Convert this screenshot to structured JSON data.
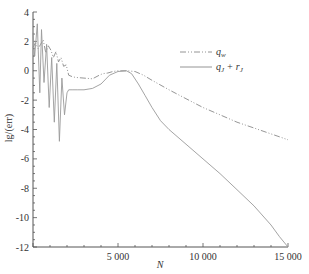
{
  "chart_data": {
    "type": "line",
    "title": "",
    "xlabel": "N",
    "ylabel": "lg/(err)",
    "xlim": [
      0,
      15000
    ],
    "ylim": [
      -12,
      4
    ],
    "x_ticks": [
      5000,
      10000,
      15000
    ],
    "x_tick_labels": [
      "5 000",
      "10 000",
      "15 000"
    ],
    "y_ticks": [
      4,
      2,
      0,
      -2,
      -4,
      -6,
      -8,
      -10,
      -12
    ],
    "y_tick_labels": [
      "4",
      "2",
      "0",
      "-2",
      "-4",
      "-6",
      "-8",
      "-10",
      "-12"
    ],
    "grid": false,
    "legend_position": "upper right",
    "series": [
      {
        "name": "q_w",
        "style": "dash-dot",
        "x": [
          0,
          150,
          300,
          450,
          600,
          750,
          900,
          1050,
          1200,
          1350,
          1500,
          1650,
          1800,
          1950,
          2100,
          2300,
          2500,
          3000,
          3500,
          3900,
          4100,
          4400,
          4700,
          5000,
          5500,
          6000,
          6500,
          7000,
          8000,
          9000,
          10000,
          11000,
          12000,
          13000,
          14000,
          14500,
          15000
        ],
        "y": [
          1.6,
          1.9,
          1.5,
          1.8,
          2.1,
          1.2,
          1.7,
          1.4,
          0.9,
          1.3,
          0.6,
          0.9,
          0.3,
          0.4,
          -0.3,
          -0.4,
          -0.45,
          -0.5,
          -0.55,
          -0.3,
          -0.2,
          -0.15,
          -0.05,
          0.0,
          0.0,
          -0.05,
          -0.3,
          -0.65,
          -1.3,
          -1.9,
          -2.5,
          -3.0,
          -3.5,
          -3.9,
          -4.3,
          -4.5,
          -4.7
        ]
      },
      {
        "name": "q_J + r_J",
        "style": "solid",
        "x": [
          0,
          100,
          250,
          400,
          500,
          650,
          800,
          950,
          1100,
          1250,
          1400,
          1550,
          1700,
          1850,
          2000,
          2100,
          2300,
          2600,
          3000,
          3500,
          4000,
          4500,
          5000,
          5500,
          5800,
          6200,
          6600,
          7000,
          7500,
          8000,
          9000,
          10000,
          11000,
          12000,
          13000,
          14000,
          14500,
          15000
        ],
        "y": [
          2.6,
          1.0,
          3.2,
          -1.5,
          2.8,
          -0.8,
          1.8,
          -2.5,
          0.9,
          -3.5,
          0.5,
          -4.8,
          -0.5,
          -3.0,
          -1.5,
          -1.3,
          -1.3,
          -1.3,
          -1.3,
          -1.2,
          -0.9,
          -0.3,
          -0.05,
          0.0,
          -0.2,
          -0.9,
          -1.7,
          -2.5,
          -3.4,
          -4.0,
          -5.0,
          -6.0,
          -7.0,
          -8.1,
          -9.2,
          -10.5,
          -11.3,
          -12.0
        ]
      }
    ]
  },
  "legend": {
    "items": [
      {
        "label_main": "q",
        "label_sub": "w",
        "extra": ""
      },
      {
        "label_main": "q",
        "label_sub": "J",
        "extra": " + r",
        "extra_sub": "J"
      }
    ]
  }
}
